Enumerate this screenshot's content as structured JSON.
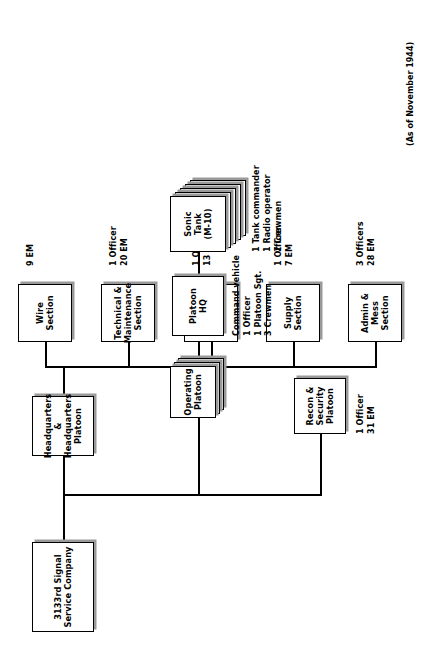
{
  "chart": {
    "as_of_note": "(As of November 1944)",
    "root": {
      "label_line1": "3133rd Signal",
      "label_line2": "Service Company"
    },
    "hq_platoon": {
      "label_line1": "Headquarters &",
      "label_line2": "Headquarters",
      "label_line3": "Platoon"
    },
    "sections": [
      {
        "name": "admin-mess-section",
        "label_line1": "Admin & Mess",
        "label_line2": "Section",
        "strength_line1": "3 Officers",
        "strength_line2": "28 EM"
      },
      {
        "name": "supply-section",
        "label_line1": "Supply",
        "label_line2": "Section",
        "strength_line1": "1 Officer",
        "strength_line2": "7 EM"
      },
      {
        "name": "motor-transport-section",
        "label_line1": "Motor Transport",
        "label_line2": "Section",
        "strength_line1": "1 Officer",
        "strength_line2": "13 EM"
      },
      {
        "name": "technical-maintenance-section",
        "label_line1": "Technical &",
        "label_line2": "Maintenance",
        "label_line3": "Section",
        "strength_line1": "1 Officer",
        "strength_line2": "20 EM"
      },
      {
        "name": "wire-section",
        "label_line1": "Wire",
        "label_line2": "Section",
        "strength_line1": "9 EM",
        "strength_line2": ""
      }
    ],
    "operating_platoon": {
      "label_line1": "Operating",
      "label_line2": "Platoon"
    },
    "platoon_hq": {
      "label_line1": "Platoon",
      "label_line2": "HQ",
      "detail_line1": "Command vehicle",
      "detail_line2": "1 Officer",
      "detail_line3": "1 Platoon Sgt.",
      "detail_line4": "3 Crewmen"
    },
    "sonic_tank": {
      "label_line1": "Sonic Tank",
      "label_line2": "(M-10)",
      "detail_line1": "1 Tank commander",
      "detail_line2": "1 Radio operator",
      "detail_line3": "2 Crewmen"
    },
    "recon_platoon": {
      "label_line1": "Recon &",
      "label_line2": "Security Platoon",
      "strength_line1": "1 Officer",
      "strength_line2": "31 EM"
    }
  }
}
